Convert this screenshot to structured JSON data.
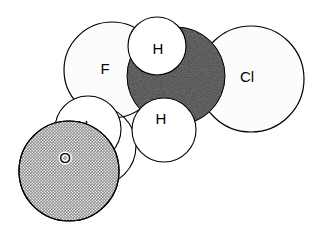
{
  "figure": {
    "kind": "space-filling-molecular-model",
    "width": 319,
    "height": 227,
    "background_color": "#ffffff",
    "outline_color": "#000000"
  },
  "palette": {
    "fluorine_fill": "#b0b0b0",
    "chlorine_fill": "#b0b0b0",
    "oxygen_fill": "#9a9a9a",
    "carbon_fill": "#1e1e1e",
    "hydrogen_fill": "#ffffff",
    "label_color": "#000000",
    "outline_color": "#000000"
  },
  "atoms": [
    {
      "id": "atom-h-lower-left",
      "element": "H",
      "label": "",
      "cx": 96,
      "cy": 146,
      "r": 40,
      "style": "hydrogen",
      "z": 1,
      "show_label": false
    },
    {
      "id": "atom-f",
      "element": "F",
      "label": "F",
      "cx": 112,
      "cy": 70,
      "r": 48,
      "style": "fluorine",
      "z": 2,
      "label_x": 105,
      "label_y": 70,
      "label_size": 15,
      "show_label": true
    },
    {
      "id": "atom-h-left",
      "element": "H",
      "label": "H",
      "cx": 88,
      "cy": 129,
      "r": 33,
      "style": "hydrogen",
      "z": 3,
      "label_x": 83,
      "label_y": 127,
      "label_size": 15,
      "show_label": true
    },
    {
      "id": "atom-o",
      "element": "O",
      "label": "O",
      "cx": 69,
      "cy": 171,
      "r": 50,
      "style": "oxygen",
      "z": 4,
      "label_x": 65,
      "label_y": 159,
      "label_size": 15,
      "show_label": true
    },
    {
      "id": "atom-cl",
      "element": "Cl",
      "label": "Cl",
      "cx": 251,
      "cy": 79,
      "r": 53,
      "style": "chlorine",
      "z": 5,
      "label_x": 247,
      "label_y": 78,
      "label_size": 15,
      "show_label": true
    },
    {
      "id": "atom-c",
      "element": "C",
      "label": "",
      "cx": 176,
      "cy": 76,
      "r": 49,
      "style": "carbon",
      "z": 6,
      "show_label": false
    },
    {
      "id": "atom-h-lower-center",
      "element": "H",
      "label": "H",
      "cx": 164,
      "cy": 130,
      "r": 32,
      "style": "hydrogen",
      "z": 7,
      "label_x": 161,
      "label_y": 120,
      "label_size": 15,
      "show_label": true
    },
    {
      "id": "atom-h-top",
      "element": "H",
      "label": "H",
      "cx": 157,
      "cy": 46,
      "r": 29,
      "style": "hydrogen",
      "z": 8,
      "label_x": 158,
      "label_y": 50,
      "label_size": 15,
      "show_label": true
    }
  ],
  "labels": {
    "fluorine": "F",
    "chlorine": "Cl",
    "oxygen": "O",
    "hydrogen_top": "H",
    "hydrogen_lower_center": "H",
    "hydrogen_left": "H"
  }
}
